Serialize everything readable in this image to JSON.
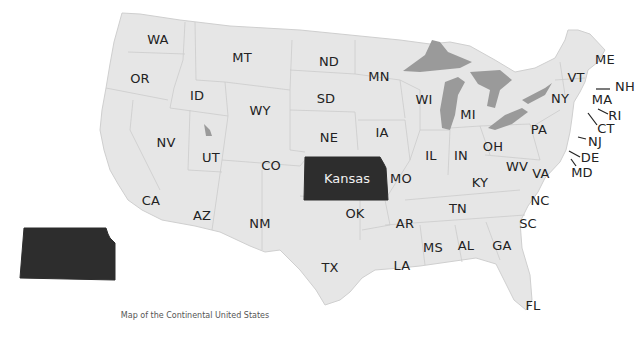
{
  "map": {
    "title": "Map of the Continental United States",
    "highlighted_state": "Kansas",
    "colors": {
      "land": "#e6e6e6",
      "border": "#cccccc",
      "lakes": "#9a9a9a",
      "highlight": "#2d2d2d",
      "label": "#222222",
      "highlight_label": "#f2f2f2"
    },
    "states": {
      "WA": "WA",
      "OR": "OR",
      "CA": "CA",
      "ID": "ID",
      "NV": "NV",
      "MT": "MT",
      "WY": "WY",
      "UT": "UT",
      "AZ": "AZ",
      "CO": "CO",
      "NM": "NM",
      "ND": "ND",
      "SD": "SD",
      "NE": "NE",
      "KS": "Kansas",
      "OK": "OK",
      "TX": "TX",
      "MN": "MN",
      "IA": "IA",
      "MO": "MO",
      "AR": "AR",
      "LA": "LA",
      "WI": "WI",
      "IL": "IL",
      "MI": "MI",
      "IN": "IN",
      "OH": "OH",
      "KY": "KY",
      "TN": "TN",
      "MS": "MS",
      "AL": "AL",
      "GA": "GA",
      "FL": "FL",
      "SC": "SC",
      "NC": "NC",
      "VA": "VA",
      "WV": "WV",
      "PA": "PA",
      "NY": "NY",
      "VT": "VT",
      "ME": "ME",
      "NH": "NH",
      "MA": "MA",
      "RI": "RI",
      "CT": "CT",
      "NJ": "NJ",
      "DE": "DE",
      "MD": "MD"
    }
  }
}
